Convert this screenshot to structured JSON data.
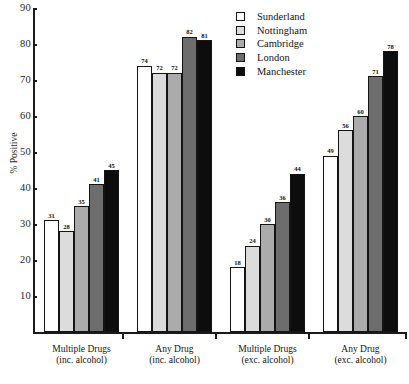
{
  "chart_data": {
    "type": "bar",
    "title": "",
    "xlabel": "",
    "ylabel": "% Positive",
    "ylim": [
      0,
      90
    ],
    "ytick_labels": [
      "90",
      "80",
      "70",
      "60",
      "50",
      "40",
      "30",
      "20",
      "10"
    ],
    "ytick_values": [
      90,
      80,
      70,
      60,
      50,
      40,
      30,
      20,
      10
    ],
    "grid": false,
    "legend_position": "top-right",
    "categories": [
      "Multiple Drugs (inc. alcohol)",
      "Any Drug (inc. alcohol)",
      "Multiple Drugs (exc. alcohol)",
      "Any Drug (exc. alcohol)"
    ],
    "category_lines": [
      {
        "line1": "Multiple Drugs",
        "line2": "(inc. alcohol)"
      },
      {
        "line1": "Any Drug",
        "line2": "(inc. alcohol)"
      },
      {
        "line1": "Multiple Drugs",
        "line2": "(exc. alcohol)"
      },
      {
        "line1": "Any Drug",
        "line2": "(exc. alcohol)"
      }
    ],
    "series": [
      {
        "name": "Sunderland",
        "color": "#ffffff",
        "values": [
          31,
          74,
          18,
          49
        ]
      },
      {
        "name": "Nottingham",
        "color": "#dcdcdc",
        "values": [
          28,
          72,
          24,
          56
        ]
      },
      {
        "name": "Cambridge",
        "color": "#ababab",
        "values": [
          35,
          72,
          30,
          60
        ]
      },
      {
        "name": "London",
        "color": "#6d6d6d",
        "values": [
          41,
          82,
          36,
          71
        ]
      },
      {
        "name": "Manchester",
        "color": "#0d0d0d",
        "values": [
          45,
          81,
          44,
          78
        ]
      }
    ]
  },
  "legend": {
    "entries": [
      {
        "label": "Sunderland",
        "color": "#ffffff"
      },
      {
        "label": "Nottingham",
        "color": "#dcdcdc"
      },
      {
        "label": "Cambridge",
        "color": "#ababab"
      },
      {
        "label": "London",
        "color": "#6d6d6d"
      },
      {
        "label": "Manchester",
        "color": "#0d0d0d"
      }
    ]
  }
}
